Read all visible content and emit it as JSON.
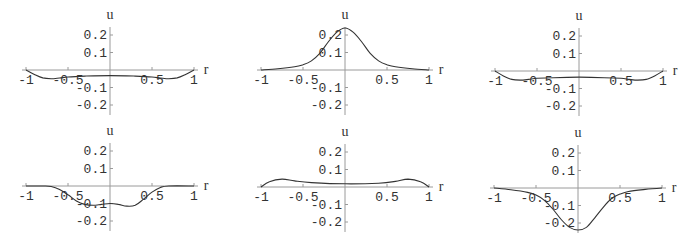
{
  "figure": {
    "layout": "2x3 grid of small line plots",
    "colors": {
      "axis": "#9a9a9a",
      "curve": "#333333",
      "text": "#333333",
      "background": "#ffffff"
    }
  },
  "chart_data": [
    {
      "type": "line",
      "position": "row1-col1",
      "title": "",
      "xlabel": "r",
      "ylabel": "u",
      "xlim": [
        -1,
        1
      ],
      "ylim": [
        -0.25,
        0.25
      ],
      "xticks": [
        "-1",
        "-0.5",
        "0.5",
        "1"
      ],
      "yticks": [
        "0.2",
        "0.1",
        "-0.1",
        "-0.2"
      ],
      "grid": false,
      "legend": null,
      "origin": [
        110,
        70
      ],
      "x": [
        -1,
        -0.9,
        -0.8,
        -0.7,
        -0.6,
        -0.5,
        -0.3,
        0,
        0.3,
        0.5,
        0.6,
        0.7,
        0.8,
        0.9,
        1
      ],
      "y": [
        0,
        -0.025,
        -0.045,
        -0.05,
        -0.046,
        -0.04,
        -0.035,
        -0.032,
        -0.035,
        -0.04,
        -0.046,
        -0.05,
        -0.045,
        -0.025,
        0
      ]
    },
    {
      "type": "line",
      "position": "row1-col2",
      "title": "",
      "xlabel": "r",
      "ylabel": "u",
      "xlim": [
        -1,
        1
      ],
      "ylim": [
        -0.25,
        0.25
      ],
      "xticks": [
        "-1",
        "-0.5",
        "0.5",
        "1"
      ],
      "yticks": [
        "0.2",
        "0.1",
        "-0.1",
        "-0.2"
      ],
      "grid": false,
      "legend": null,
      "origin": [
        345,
        70
      ],
      "x": [
        -1,
        -0.8,
        -0.6,
        -0.5,
        -0.4,
        -0.3,
        -0.2,
        -0.1,
        0,
        0.1,
        0.2,
        0.3,
        0.4,
        0.5,
        0.6,
        0.8,
        1
      ],
      "y": [
        0,
        0.007,
        0.018,
        0.03,
        0.052,
        0.095,
        0.16,
        0.215,
        0.24,
        0.215,
        0.16,
        0.095,
        0.052,
        0.03,
        0.018,
        0.007,
        0
      ]
    },
    {
      "type": "line",
      "position": "row1-col3",
      "title": "",
      "xlabel": "r",
      "ylabel": "u",
      "xlim": [
        -1,
        1
      ],
      "ylim": [
        -0.25,
        0.25
      ],
      "xticks": [
        "-1",
        "-0.5",
        "0.5",
        "1"
      ],
      "yticks": [
        "0.2",
        "0.1",
        "-0.1",
        "-0.2"
      ],
      "grid": false,
      "legend": null,
      "origin": [
        579,
        71
      ],
      "x": [
        -1,
        -0.9,
        -0.8,
        -0.7,
        -0.6,
        -0.5,
        -0.3,
        0,
        0.3,
        0.5,
        0.6,
        0.7,
        0.8,
        0.9,
        1
      ],
      "y": [
        0,
        -0.028,
        -0.048,
        -0.052,
        -0.048,
        -0.042,
        -0.038,
        -0.035,
        -0.038,
        -0.042,
        -0.048,
        -0.052,
        -0.048,
        -0.028,
        0
      ]
    },
    {
      "type": "line",
      "position": "row2-col1",
      "title": "",
      "xlabel": "r",
      "ylabel": "u",
      "xlim": [
        -1,
        1
      ],
      "ylim": [
        -0.25,
        0.25
      ],
      "xticks": [
        "-1",
        "-0.5",
        "0.5",
        "1"
      ],
      "yticks": [
        "0.2",
        "0.1",
        "-0.1",
        "-0.2"
      ],
      "grid": false,
      "legend": null,
      "origin": [
        110,
        186
      ],
      "x": [
        -1,
        -0.8,
        -0.7,
        -0.6,
        -0.5,
        -0.4,
        -0.3,
        -0.2,
        -0.1,
        0,
        0.1,
        0.2,
        0.3,
        0.4,
        0.5,
        0.6,
        0.7,
        1
      ],
      "y": [
        0,
        0,
        -0.003,
        -0.02,
        -0.05,
        -0.085,
        -0.105,
        -0.11,
        -0.105,
        -0.1,
        -0.105,
        -0.115,
        -0.11,
        -0.075,
        -0.035,
        -0.008,
        0,
        0
      ]
    },
    {
      "type": "line",
      "position": "row2-col2",
      "title": "",
      "xlabel": "r",
      "ylabel": "u",
      "xlim": [
        -1,
        1
      ],
      "ylim": [
        -0.25,
        0.25
      ],
      "xticks": [
        "-1",
        "-0.5",
        "0.5",
        "1"
      ],
      "yticks": [
        "0.2",
        "0.1",
        "-0.1",
        "-0.2"
      ],
      "grid": false,
      "legend": null,
      "origin": [
        345,
        187
      ],
      "x": [
        -1,
        -0.9,
        -0.75,
        -0.6,
        -0.4,
        0,
        0.4,
        0.6,
        0.75,
        0.9,
        1
      ],
      "y": [
        0,
        0.03,
        0.045,
        0.035,
        0.025,
        0.018,
        0.022,
        0.032,
        0.045,
        0.03,
        0
      ]
    },
    {
      "type": "line",
      "position": "row2-col3",
      "title": "",
      "xlabel": "r",
      "ylabel": "u",
      "xlim": [
        -1,
        1
      ],
      "ylim": [
        -0.25,
        0.25
      ],
      "xticks": [
        "-1",
        "-0.5",
        "0.5",
        "1"
      ],
      "yticks": [
        "0.2",
        "0.1",
        "-0.1",
        "-0.2"
      ],
      "grid": false,
      "legend": null,
      "origin": [
        578,
        188
      ],
      "x": [
        -1,
        -0.8,
        -0.6,
        -0.5,
        -0.4,
        -0.3,
        -0.2,
        -0.1,
        0,
        0.1,
        0.2,
        0.3,
        0.4,
        0.5,
        0.6,
        0.8,
        1
      ],
      "y": [
        0,
        -0.01,
        -0.025,
        -0.04,
        -0.07,
        -0.12,
        -0.18,
        -0.225,
        -0.24,
        -0.225,
        -0.17,
        -0.11,
        -0.06,
        -0.035,
        -0.02,
        -0.008,
        0
      ]
    }
  ]
}
